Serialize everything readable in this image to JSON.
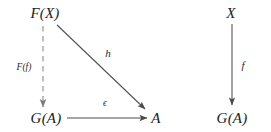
{
  "figure": {
    "kind": "commutative-diagram",
    "background_color": "#ffffff",
    "ink_color": "#3a3a3a",
    "text_color": "#1c1c1c"
  },
  "diagrams": [
    {
      "name": "left-diagram",
      "objects": [
        {
          "id": "FX",
          "label": "F(X)",
          "x": 45,
          "y": 13
        },
        {
          "id": "GA",
          "label": "G(A)",
          "x": 46,
          "y": 118
        },
        {
          "id": "A",
          "label": "A",
          "x": 156,
          "y": 118
        }
      ],
      "arrows": [
        {
          "id": "Ff",
          "label": "F(f)",
          "style": "dashed",
          "from": "FX",
          "to": "GA",
          "x1": 43,
          "y1": 26,
          "x2": 43,
          "y2": 107,
          "label_x": 24,
          "label_y": 68
        },
        {
          "id": "h",
          "label": "h",
          "style": "solid",
          "from": "FX",
          "to": "A",
          "x1": 57,
          "y1": 25,
          "x2": 145,
          "y2": 109,
          "label_x": 108,
          "label_y": 53
        },
        {
          "id": "epsilon",
          "label": "ϵ",
          "style": "solid",
          "from": "GA",
          "to": "A",
          "x1": 67,
          "y1": 118,
          "x2": 147,
          "y2": 118,
          "label_x": 105,
          "label_y": 104
        }
      ]
    },
    {
      "name": "right-diagram",
      "objects": [
        {
          "id": "X",
          "label": "X",
          "x": 231,
          "y": 13
        },
        {
          "id": "GA2",
          "label": "G(A)",
          "x": 232,
          "y": 118
        }
      ],
      "arrows": [
        {
          "id": "f",
          "label": "f",
          "style": "solid",
          "from": "X",
          "to": "GA2",
          "x1": 232,
          "y1": 24,
          "x2": 232,
          "y2": 105,
          "label_x": 243,
          "label_y": 65
        }
      ]
    }
  ]
}
